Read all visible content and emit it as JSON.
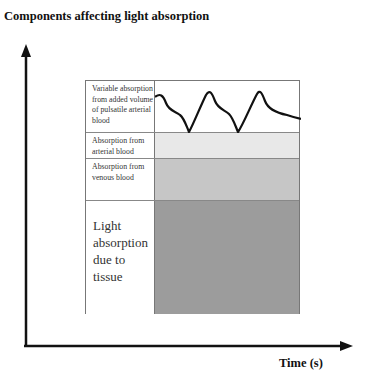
{
  "diagram": {
    "y_axis_title": "Components affecting light absorption",
    "x_axis_title": "Time (s)",
    "layers": [
      {
        "id": "pulsatile",
        "label": "Variable absorption from added volume of pulsatile arterial blood",
        "fill": "#ffffff",
        "content": "pulsatile-waveform"
      },
      {
        "id": "arterial",
        "label": "Absorption from arterial blood",
        "fill": "#e8e8e8"
      },
      {
        "id": "venous",
        "label": "Absorption from venous blood",
        "fill": "#c6c6c6"
      },
      {
        "id": "tissue",
        "label": "Light absorption due to tissue",
        "fill": "#9c9c9c"
      }
    ],
    "waveform": {
      "cycles_visible": 2.5,
      "color": "#111111"
    }
  }
}
